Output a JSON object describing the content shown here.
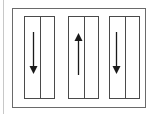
{
  "diagram": {
    "type": "lane-direction-diagram",
    "lanes": [
      {
        "index": 1,
        "direction": "down",
        "icon": "arrow-down-icon"
      },
      {
        "index": 2,
        "direction": "up",
        "icon": "arrow-up-icon"
      },
      {
        "index": 3,
        "direction": "down",
        "icon": "arrow-down-icon"
      }
    ],
    "colors": {
      "stroke": "#4a4a4a",
      "frame": "#6a6a6a",
      "arrow": "#1a1a1a",
      "background": "#ffffff"
    }
  }
}
